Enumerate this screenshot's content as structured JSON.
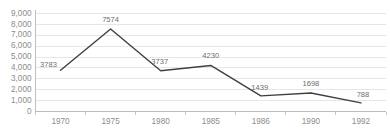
{
  "chart_data": {
    "type": "line",
    "title": "",
    "subtitle": "",
    "xlabel": "",
    "ylabel": "",
    "categories": [
      "1970",
      "1975",
      "1980",
      "1985",
      "1986",
      "1990",
      "1992"
    ],
    "values": [
      3783,
      7574,
      3737,
      4230,
      1439,
      1698,
      788
    ],
    "point_labels": [
      "3783",
      "7574",
      "3737",
      "4230",
      "1439",
      "1698",
      "788"
    ],
    "series": [
      {
        "name": "",
        "values": [
          3783,
          7574,
          3737,
          4230,
          1439,
          1698,
          788
        ],
        "color": "#404040"
      }
    ],
    "ylim": [
      0,
      9000
    ],
    "ytick_values": [
      0,
      1000,
      2000,
      3000,
      4000,
      5000,
      6000,
      7000,
      8000,
      9000
    ],
    "ytick_labels": [
      "0",
      "1,000",
      "2,000",
      "3,000",
      "4,000",
      "5,000",
      "6,000",
      "7,000",
      "8,000",
      "9,000"
    ],
    "grid": true,
    "grid_axis": "y",
    "legend": false,
    "legend_position": "none",
    "markers": false,
    "annotations": []
  },
  "style": {
    "background_color": "#ffffff",
    "line_color": "#404040",
    "gridline_color": "#dcdcdc",
    "axis_color": "#b0b0b0",
    "tick_label_color": "#8c8c8c",
    "point_label_color": "#6e6e6e"
  }
}
